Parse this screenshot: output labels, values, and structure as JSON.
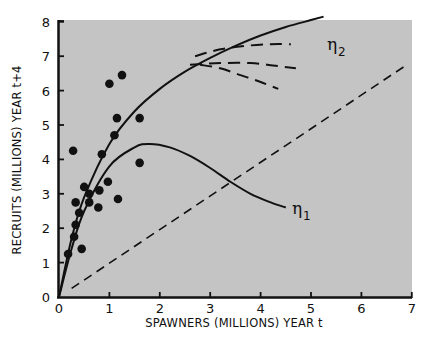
{
  "chart_data": {
    "type": "scatter",
    "title": "",
    "xlabel": "SPAWNERS (MILLIONS) YEAR t",
    "ylabel": "RECRUITS (MILLIONS) YEAR t+4",
    "xlim": [
      0,
      7
    ],
    "ylim": [
      0,
      8
    ],
    "x_ticks": [
      "0",
      "1",
      "2",
      "3",
      "4",
      "5",
      "6",
      "7"
    ],
    "y_ticks": [
      "0",
      "1",
      "2",
      "3",
      "4",
      "5",
      "6",
      "7",
      "8"
    ],
    "grid": false,
    "background": "#c4c4c4",
    "points": [
      [
        0.28,
        4.25
      ],
      [
        1.0,
        6.2
      ],
      [
        1.25,
        6.45
      ],
      [
        1.15,
        5.2
      ],
      [
        1.6,
        5.2
      ],
      [
        1.1,
        4.7
      ],
      [
        0.85,
        4.15
      ],
      [
        1.6,
        3.9
      ],
      [
        0.97,
        3.35
      ],
      [
        0.5,
        3.2
      ],
      [
        0.6,
        3.0
      ],
      [
        0.8,
        3.1
      ],
      [
        0.6,
        2.75
      ],
      [
        0.78,
        2.6
      ],
      [
        1.17,
        2.85
      ],
      [
        0.33,
        2.75
      ],
      [
        0.4,
        2.45
      ],
      [
        0.33,
        2.1
      ],
      [
        0.3,
        1.75
      ],
      [
        0.18,
        1.25
      ],
      [
        0.45,
        1.4
      ]
    ],
    "series": [
      {
        "name": "η2 (solid, asymptotic)",
        "style": "solid",
        "x": [
          0,
          0.25,
          0.5,
          1,
          1.5,
          2,
          2.5,
          3,
          3.5,
          4,
          4.5,
          5,
          5.25
        ],
        "y": [
          0,
          1.7,
          2.9,
          4.45,
          5.4,
          6.05,
          6.55,
          6.95,
          7.3,
          7.6,
          7.85,
          8.05,
          8.15
        ]
      },
      {
        "name": "η1 (solid, dome)",
        "style": "solid",
        "x": [
          0,
          0.25,
          0.5,
          1,
          1.5,
          1.8,
          2.2,
          2.6,
          3,
          3.4,
          3.8,
          4.2,
          4.5
        ],
        "y": [
          0,
          1.4,
          2.5,
          3.8,
          4.35,
          4.45,
          4.35,
          4.1,
          3.75,
          3.35,
          3.0,
          2.75,
          2.6
        ]
      },
      {
        "name": "branch upper (dashed)",
        "style": "dashed",
        "x": [
          2.7,
          3.2,
          3.7,
          4.2,
          4.6
        ],
        "y": [
          7.0,
          7.2,
          7.3,
          7.35,
          7.35
        ]
      },
      {
        "name": "branch middle (dashed)",
        "style": "dashed",
        "x": [
          2.6,
          3.2,
          3.8,
          4.3,
          4.7
        ],
        "y": [
          6.75,
          6.8,
          6.8,
          6.72,
          6.65
        ]
      },
      {
        "name": "branch lower (dashed)",
        "style": "dashed",
        "x": [
          2.8,
          3.2,
          3.6,
          4.0,
          4.35
        ],
        "y": [
          6.75,
          6.65,
          6.45,
          6.25,
          6.05
        ]
      },
      {
        "name": "replacement line (dashed)",
        "style": "dashed",
        "x": [
          0.25,
          6.9
        ],
        "y": [
          0.25,
          6.75
        ]
      }
    ],
    "annotations": [
      {
        "text": "η",
        "subscript": "2",
        "x": 5.4,
        "y": 7.3
      },
      {
        "text": "η",
        "subscript": "1",
        "x": 4.65,
        "y": 2.45
      }
    ]
  },
  "labels": {
    "xlabel": "SPAWNERS (MILLIONS) YEAR t",
    "ylabel": "RECRUITS (MILLIONS) YEAR t+4",
    "eta": "η",
    "eta1_sub": "1",
    "eta2_sub": "2"
  }
}
